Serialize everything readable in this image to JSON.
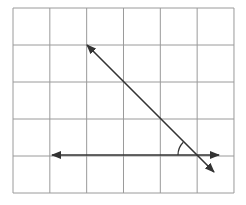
{
  "diagram": {
    "type": "grid-lines-angle",
    "grid": {
      "cols": 6,
      "rows": 5,
      "x0": 13,
      "y0": 8,
      "cell_w": 36.83,
      "cell_h": 37,
      "color": "#9a9a9a"
    },
    "lines": [
      {
        "name": "transversal",
        "from": [
          87,
          45
        ],
        "to": [
          214,
          172
        ],
        "arrows": "both",
        "color": "#333333"
      },
      {
        "name": "horizontal-line",
        "from": [
          52,
          155
        ],
        "to": [
          219,
          155
        ],
        "arrows": "both",
        "color": "#333333"
      }
    ],
    "angle_mark": {
      "center": [
        196,
        155
      ],
      "radius": 18,
      "color": "#333333"
    }
  }
}
